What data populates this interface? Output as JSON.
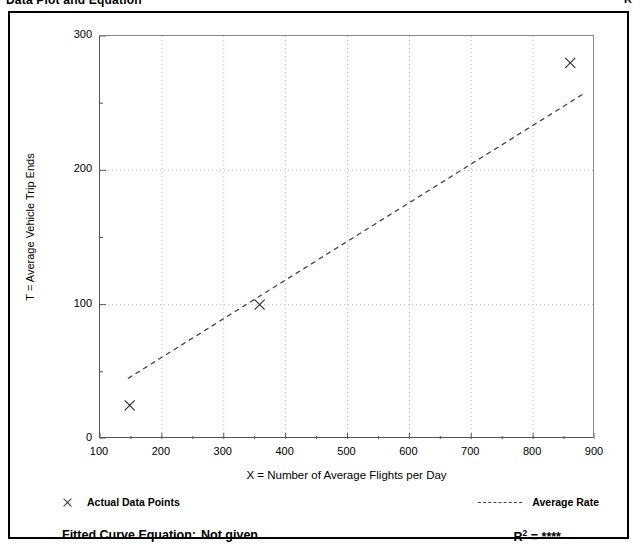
{
  "header": {
    "title": "Data Plot and Equation",
    "right_note": "R"
  },
  "chart_data": {
    "type": "scatter",
    "title": "Data Plot and Equation",
    "xlabel": "X = Number of Average Flights per Day",
    "ylabel": "T = Average Vehicle Trip Ends",
    "xlim": [
      100,
      900
    ],
    "ylim": [
      0,
      300
    ],
    "xticks": [
      100,
      200,
      300,
      400,
      500,
      600,
      700,
      800,
      900
    ],
    "yticks": [
      0,
      100,
      200,
      300
    ],
    "xtick_labels": [
      "100",
      "200",
      "300",
      "400",
      "500",
      "600",
      "700",
      "800",
      "900"
    ],
    "ytick_labels": [
      "0",
      "100",
      "200",
      "300"
    ],
    "x_minor_interval": 50,
    "y_minor_interval": 50,
    "grid": true,
    "grid_style": "dotted",
    "grid_color": "#bdbdbd",
    "series": [
      {
        "name": "Actual Data Points",
        "type": "scatter",
        "marker": "x",
        "color": "#333333",
        "points": [
          {
            "x": 148,
            "y": 25
          },
          {
            "x": 358,
            "y": 100
          },
          {
            "x": 860,
            "y": 280
          }
        ]
      },
      {
        "name": "Average Rate",
        "type": "line",
        "style": "dashed",
        "color": "#444444",
        "x": [
          145,
          885
        ],
        "y": [
          45,
          258
        ]
      }
    ],
    "legend": [
      {
        "label": "Actual Data Points",
        "marker": "x",
        "position": "bottom-left"
      },
      {
        "label": "Average Rate",
        "marker": "dashed-line",
        "position": "bottom-right"
      }
    ],
    "annotations": {
      "fitted_curve_label": "Fitted Curve Equation:",
      "fitted_curve_value": "Not given",
      "r_squared_label": "R",
      "r_squared_exponent": "2",
      "r_squared_equals": " = ",
      "r_squared_value": "****"
    }
  }
}
